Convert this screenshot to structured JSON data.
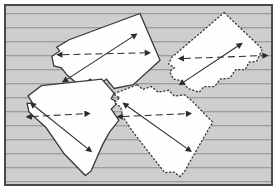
{
  "figure": {
    "canvas": {
      "width": 277,
      "height": 190
    },
    "border": {
      "color": "#4a4a4a",
      "width": 2,
      "margin": 4
    }
  },
  "background": {
    "name": "horizontal-striped-texture",
    "fill_color": "#cececd",
    "line_color": "#8e8e8e",
    "line_spacing": 14,
    "line_count": 13,
    "orientation": "horizontal"
  },
  "regions": [
    {
      "id": "region-top-left",
      "label": "Region 1",
      "outline_style": "solid",
      "fill_color": "#fefefe",
      "stroke_color": "#3a3a3a",
      "polygon": "140,8 161,58 133,84 113,88 105,78 95,86 88,78 78,86 64,74 58,66 50,64 48,54 56,48 53,44 66,36",
      "minor_axis": {
        "style": "dashed",
        "from": [
          59,
          52
        ],
        "to": [
          145,
          50
        ],
        "double_headed": true
      },
      "major_axis": {
        "style": "solid",
        "from": [
          64,
          78
        ],
        "to": [
          132,
          33
        ],
        "double_headed": true
      }
    },
    {
      "id": "region-top-right",
      "label": "Region 2",
      "outline_style": "dashed",
      "fill_color": "#fefefe",
      "stroke_color": "#3a3a3a",
      "polygon": "228,7 268,46 262,59 254,60 250,68 240,68 234,77 224,78 218,86 207,86 202,92 190,88 184,80 175,78 171,70 176,66 170,62 173,55",
      "minor_axis": {
        "style": "dashed",
        "from": [
          186,
          56
        ],
        "to": [
          268,
          53
        ],
        "double_headed": true
      },
      "major_axis": {
        "style": "solid",
        "from": [
          186,
          81
        ],
        "to": [
          242,
          43
        ],
        "double_headed": true
      }
    },
    {
      "id": "region-bottom-left",
      "label": "Region 3",
      "outline_style": "solid",
      "fill_color": "#fefefe",
      "stroke_color": "#3a3a3a",
      "polygon": "37,85 100,78 113,93 110,99 117,103 110,110 118,122 108,135 101,148 89,176 83,181 61,158 42,130 24,113 22,104 28,104 23,96",
      "minor_axis": {
        "style": "dashed",
        "from": [
          27,
          118
        ],
        "to": [
          82,
          115
        ],
        "double_headed": true
      },
      "major_axis": {
        "style": "solid",
        "from": [
          30,
          107
        ],
        "to": [
          85,
          152
        ],
        "double_headed": true
      }
    },
    {
      "id": "region-bottom-right",
      "label": "Region 4",
      "outline_style": "dashed",
      "fill_color": "#fefefe",
      "stroke_color": "#3a3a3a",
      "polygon": "137,84 143,89 152,86 159,92 170,90 176,96 187,95 194,101 216,124 194,163 187,176 182,182 175,177 166,178 133,135 122,118 120,108 113,103 119,98 112,94",
      "minor_axis": {
        "style": "dashed",
        "from": [
          122,
          118
        ],
        "to": [
          188,
          115
        ],
        "double_headed": true
      },
      "major_axis": {
        "style": "solid",
        "from": [
          127,
          107
        ],
        "to": [
          189,
          152
        ],
        "double_headed": true
      }
    }
  ],
  "annotations": {
    "minor_axis_label": "minor axis (dashed double arrow)",
    "major_axis_label": "major axis (solid double arrow)",
    "arrow_color": "#2b2b2b"
  },
  "chart_data": {
    "type": "diagram",
    "xlabel": "",
    "ylabel": "",
    "items": [
      {
        "name": "Region 1",
        "outline": "solid",
        "minor_axis_length_px": 86,
        "major_axis_length_px": 81
      },
      {
        "name": "Region 2",
        "outline": "dashed",
        "minor_axis_length_px": 82,
        "major_axis_length_px": 68
      },
      {
        "name": "Region 3",
        "outline": "solid",
        "minor_axis_length_px": 55,
        "major_axis_length_px": 71
      },
      {
        "name": "Region 4",
        "outline": "dashed",
        "minor_axis_length_px": 66,
        "major_axis_length_px": 77
      }
    ]
  }
}
